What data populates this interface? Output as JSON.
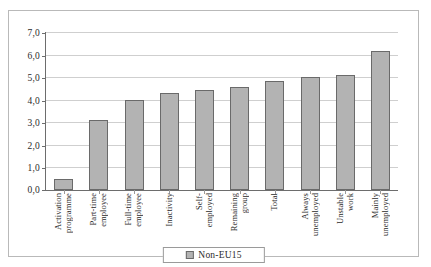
{
  "chart_data": {
    "type": "bar",
    "title": "",
    "subtitle": "",
    "xlabel": "",
    "ylabel": "",
    "ylim": [
      0.0,
      7.0
    ],
    "ytick_step": 1.0,
    "ytick_labels": [
      "7,0",
      "6,0",
      "5,0",
      "4,0",
      "3,0",
      "2,0",
      "1,0",
      "0,0"
    ],
    "ytick_values": [
      7.0,
      6.0,
      5.0,
      4.0,
      3.0,
      2.0,
      1.0,
      0.0
    ],
    "decimal_separator": ",",
    "grid": true,
    "grid_axis": "y",
    "legend_position": "bottom-center",
    "categories": [
      "Activation programme",
      "Part-time employee",
      "Full-time employee",
      "Inactivity",
      "Self-employed",
      "Remaining group",
      "Total",
      "Always unemployed",
      "Unstable work",
      "Mainly unemployed"
    ],
    "category_lines": [
      [
        "Activation",
        "programme"
      ],
      [
        "Part-time",
        "employee"
      ],
      [
        "Full-time",
        "employee"
      ],
      [
        "Inactivity"
      ],
      [
        "Self-",
        "employed"
      ],
      [
        "Remaining",
        "group"
      ],
      [
        "Total"
      ],
      [
        "Always",
        "unemployed"
      ],
      [
        "Unstable",
        "work"
      ],
      [
        "Mainly",
        "unemployed"
      ]
    ],
    "series": [
      {
        "name": "Non-EU15",
        "color": "#b3b3b3",
        "values": [
          0.5,
          3.1,
          4.0,
          4.3,
          4.45,
          4.55,
          4.85,
          5.0,
          5.1,
          6.15
        ]
      }
    ]
  },
  "legend": {
    "entries": [
      {
        "label": "Non-EU15",
        "color": "#b3b3b3"
      }
    ]
  },
  "colors": {
    "bar_fill": "#b3b3b3",
    "bar_border": "#6a6a6a",
    "gridline": "#cfcfcf",
    "axis": "#6d6d6d",
    "frame": "#b9b9b9",
    "text": "#2b2b2b"
  }
}
